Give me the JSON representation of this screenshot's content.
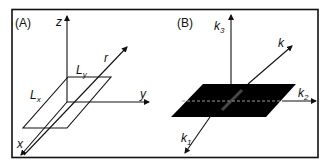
{
  "figure": {
    "panels": [
      {
        "id": "A",
        "label": "(A)",
        "axes": {
          "z": "z",
          "y": "y",
          "x": "x",
          "r": "r"
        },
        "dimensions": {
          "Lx": {
            "base": "L",
            "sub": "x"
          },
          "Ly": {
            "base": "L",
            "sub": "y"
          }
        },
        "plane_fill": "none"
      },
      {
        "id": "B",
        "label": "(B)",
        "axes": {
          "k3": {
            "base": "k",
            "sub": "3"
          },
          "k2": {
            "base": "k",
            "sub": "2"
          },
          "k1": {
            "base": "k",
            "sub": "1"
          },
          "k": "k"
        },
        "plane_fill": "#000000",
        "dashed_line_color": "#9a9a9a"
      }
    ],
    "colors": {
      "line": "#111111",
      "frame": "#111111",
      "background": "#ffffff"
    }
  }
}
